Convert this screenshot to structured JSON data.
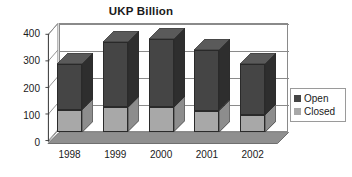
{
  "chart_data": {
    "type": "bar",
    "subtype": "stacked-column-3d",
    "title": "UKP Billion",
    "xlabel": "",
    "ylabel": "",
    "categories": [
      "1998",
      "1999",
      "2000",
      "2001",
      "2002"
    ],
    "series": [
      {
        "name": "Closed",
        "color": "#a8a8a8",
        "values": [
          82,
          90,
          90,
          78,
          63
        ]
      },
      {
        "name": "Open",
        "color": "#454545",
        "values": [
          168,
          240,
          250,
          222,
          187
        ]
      }
    ],
    "totals": [
      250,
      330,
      340,
      300,
      250
    ],
    "ylim": [
      0,
      400
    ],
    "yticks": [
      0,
      100,
      200,
      300,
      400
    ],
    "ytick_labels": [
      "0",
      "100",
      "200",
      "300",
      "400"
    ],
    "grid": true,
    "gridlines": "horizontal",
    "legend": {
      "position": "right",
      "entries": [
        {
          "label": "Open",
          "color": "#454545"
        },
        {
          "label": "Closed",
          "color": "#a8a8a8"
        }
      ]
    },
    "colors": {
      "open": "#454545",
      "open_side": "#2e2e2e",
      "open_top": "#5a5a5a",
      "closed": "#a8a8a8",
      "closed_side": "#8d8d8d",
      "floor": "#8f8f8f",
      "wall_line": "#8a8a8a",
      "text": "#1a1a1a",
      "background": "#ffffff"
    }
  }
}
